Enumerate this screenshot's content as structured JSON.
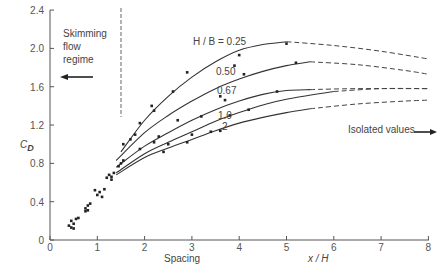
{
  "chart_data": {
    "type": "line",
    "title": "",
    "xlabel": "x / H",
    "xlabel_secondary": "Spacing",
    "ylabel": "C_D",
    "xlim": [
      0,
      8
    ],
    "ylim": [
      0,
      2.4
    ],
    "x_ticks": [
      "0",
      "1",
      "2",
      "3",
      "4",
      "5",
      "6",
      "7",
      "8"
    ],
    "y_ticks": [
      "0",
      "0.4",
      "0.8",
      "1.2",
      "1.6",
      "2.0",
      "2.4"
    ],
    "grid": false,
    "legend_prefix": "H / B",
    "series": [
      {
        "name": "0.25",
        "label": "H / B  = 0.25",
        "solid": [
          [
            1.5,
            0.92
          ],
          [
            2,
            1.25
          ],
          [
            2.5,
            1.5
          ],
          [
            3,
            1.7
          ],
          [
            3.5,
            1.86
          ],
          [
            4,
            1.98
          ],
          [
            4.5,
            2.04
          ],
          [
            5,
            2.07
          ]
        ],
        "dashed": [
          [
            5,
            2.07
          ],
          [
            6,
            2.03
          ],
          [
            7,
            1.97
          ],
          [
            8,
            1.89
          ]
        ]
      },
      {
        "name": "0.50",
        "label": "0.50",
        "solid": [
          [
            1.4,
            0.83
          ],
          [
            2,
            1.12
          ],
          [
            2.5,
            1.3
          ],
          [
            3,
            1.45
          ],
          [
            3.5,
            1.58
          ],
          [
            4,
            1.68
          ],
          [
            4.5,
            1.76
          ],
          [
            5,
            1.82
          ],
          [
            5.5,
            1.86
          ]
        ],
        "dashed": [
          [
            5.5,
            1.86
          ],
          [
            6.5,
            1.83
          ],
          [
            7.5,
            1.77
          ],
          [
            8,
            1.73
          ]
        ]
      },
      {
        "name": "0.67",
        "label": "0.67",
        "solid": [
          [
            1.4,
            0.76
          ],
          [
            2,
            0.98
          ],
          [
            2.5,
            1.12
          ],
          [
            3,
            1.25
          ],
          [
            3.5,
            1.36
          ],
          [
            4,
            1.45
          ],
          [
            4.5,
            1.52
          ],
          [
            5,
            1.56
          ],
          [
            5.5,
            1.57
          ]
        ],
        "dashed": [
          [
            5.5,
            1.57
          ],
          [
            6.5,
            1.58
          ],
          [
            8,
            1.58
          ]
        ]
      },
      {
        "name": "1.0",
        "label": "1.0",
        "solid": [
          [
            1.4,
            0.7
          ],
          [
            2,
            0.9
          ],
          [
            2.5,
            1.02
          ],
          [
            3,
            1.13
          ],
          [
            3.5,
            1.24
          ],
          [
            4,
            1.33
          ],
          [
            4.5,
            1.41
          ],
          [
            5,
            1.47
          ],
          [
            6,
            1.55
          ]
        ],
        "dashed": [
          [
            6,
            1.55
          ],
          [
            7,
            1.58
          ],
          [
            8,
            1.58
          ]
        ]
      },
      {
        "name": "2",
        "label": "2",
        "solid": [
          [
            1.4,
            0.68
          ],
          [
            2,
            0.86
          ],
          [
            2.5,
            0.96
          ],
          [
            3,
            1.05
          ],
          [
            3.5,
            1.14
          ],
          [
            4,
            1.22
          ],
          [
            4.5,
            1.28
          ],
          [
            5,
            1.33
          ],
          [
            5.5,
            1.37
          ]
        ],
        "dashed": [
          [
            5.5,
            1.37
          ],
          [
            6.5,
            1.42
          ],
          [
            7.5,
            1.45
          ],
          [
            8,
            1.46
          ]
        ]
      }
    ],
    "scatter_points": [
      [
        0.4,
        0.15
      ],
      [
        0.45,
        0.2
      ],
      [
        0.5,
        0.17
      ],
      [
        0.55,
        0.22
      ],
      [
        0.6,
        0.23
      ],
      [
        0.45,
        0.13
      ],
      [
        0.5,
        0.12
      ],
      [
        0.75,
        0.33
      ],
      [
        0.8,
        0.36
      ],
      [
        0.85,
        0.38
      ],
      [
        0.75,
        0.3
      ],
      [
        0.8,
        0.31
      ],
      [
        1.0,
        0.47
      ],
      [
        1.05,
        0.5
      ],
      [
        1.1,
        0.45
      ],
      [
        0.95,
        0.52
      ],
      [
        1.15,
        0.53
      ],
      [
        1.2,
        0.65
      ],
      [
        1.25,
        0.68
      ],
      [
        1.3,
        0.63
      ],
      [
        1.35,
        0.7
      ],
      [
        1.3,
        0.66
      ],
      [
        1.5,
        0.8
      ],
      [
        1.55,
        0.83
      ],
      [
        1.45,
        0.77
      ],
      [
        1.55,
        1.0
      ],
      [
        1.7,
        1.05
      ],
      [
        1.8,
        1.1
      ],
      [
        1.9,
        1.22
      ],
      [
        2.15,
        1.4
      ],
      [
        2.2,
        1.35
      ],
      [
        2.6,
        1.55
      ],
      [
        2.9,
        1.75
      ],
      [
        3.9,
        1.82
      ],
      [
        4.0,
        1.93
      ],
      [
        5.0,
        2.05
      ],
      [
        2.2,
        1.02
      ],
      [
        2.7,
        1.25
      ],
      [
        3.6,
        1.5
      ],
      [
        4.1,
        1.73
      ],
      [
        5.2,
        1.85
      ],
      [
        1.9,
        0.95
      ],
      [
        2.3,
        1.08
      ],
      [
        3.2,
        1.29
      ],
      [
        3.7,
        1.46
      ],
      [
        4.8,
        1.55
      ],
      [
        2.5,
        1.0
      ],
      [
        3.0,
        1.1
      ],
      [
        3.8,
        1.3
      ],
      [
        4.2,
        1.36
      ],
      [
        2.4,
        0.92
      ],
      [
        2.9,
        1.02
      ],
      [
        3.4,
        1.13
      ],
      [
        3.6,
        1.14
      ]
    ],
    "annotations": [
      {
        "text": "Skimming flow regime",
        "arrow": "left"
      },
      {
        "text": "Isolated values",
        "arrow": "right"
      }
    ],
    "reference_line": {
      "type": "vertical-dashed",
      "x": 1.5
    }
  },
  "labels": {
    "y_axis": "C",
    "y_axis_sub": "D",
    "x_axis": "x / H",
    "spacing": "Spacing",
    "skimming_1": "Skimming",
    "skimming_2": "flow",
    "skimming_3": "regime",
    "isolated": "Isolated values",
    "hb_prefix": "H / B  = 0.25",
    "c050": "0.50",
    "c067": "0.67",
    "c10": "1.0",
    "c2": "2"
  }
}
